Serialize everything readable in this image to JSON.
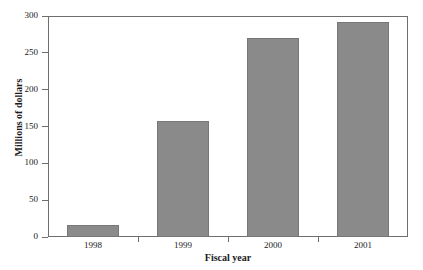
{
  "chart_data": {
    "type": "bar",
    "title": "",
    "subtitle": "",
    "categories": [
      "1998",
      "1999",
      "2000",
      "2001"
    ],
    "values": [
      16,
      158,
      270,
      292
    ],
    "series": [
      {
        "name": "Millions of dollars",
        "values": [
          16,
          158,
          270,
          292
        ]
      }
    ],
    "xlabel": "Fiscal year",
    "ylabel": "Millions of dollars",
    "ylim": [
      0,
      300
    ],
    "yticks": [
      0,
      50,
      100,
      150,
      200,
      250,
      300
    ],
    "ytick_labels": [
      "0",
      "50",
      "100",
      "150",
      "200",
      "250",
      "300"
    ],
    "xtick_labels": [
      "1998",
      "1999",
      "2000",
      "2001"
    ],
    "grid": false,
    "legend": null,
    "legend_position": "none",
    "annotations": [],
    "bar_color": "#8a8a8a",
    "bar_border_color": "#777777",
    "axis_color": "#6e6e6e",
    "text_color": "#1a1a1a",
    "background_color": "#ffffff"
  },
  "artifacts": {
    "clipped_top_text": "· ·"
  }
}
